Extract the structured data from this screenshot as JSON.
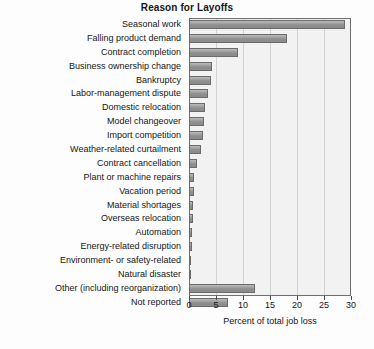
{
  "chart_data": {
    "type": "bar",
    "orientation": "horizontal",
    "title": "Reason for Layoffs",
    "xlabel": "Percent of total job loss",
    "ylabel": "",
    "xlim": [
      0,
      30
    ],
    "xticks": [
      0,
      5,
      10,
      15,
      20,
      25,
      30
    ],
    "xtick_labels": [
      "0",
      "5",
      "10",
      "15",
      "20",
      "25",
      "30"
    ],
    "grid": true,
    "legend": null,
    "categories": [
      "Seasonal work",
      "Falling product demand",
      "Contract completion",
      "Business ownership change",
      "Bankruptcy",
      "Labor-management dispute",
      "Domestic relocation",
      "Model changeover",
      "Import competition",
      "Weather-related curtailment",
      "Contract cancellation",
      "Plant or machine repairs",
      "Vacation period",
      "Material shortages",
      "Overseas relocation",
      "Automation",
      "Energy-related disruption",
      "Environment- or safety-related",
      "Natural disaster",
      "Other (including reorganization)",
      "Not reported"
    ],
    "values": [
      28.8,
      18.2,
      9.0,
      4.2,
      4.0,
      3.6,
      3.0,
      2.8,
      2.6,
      2.2,
      1.4,
      1.0,
      0.9,
      0.8,
      0.7,
      0.5,
      0.5,
      0.4,
      0.3,
      12.2,
      7.2
    ],
    "bar_color": "#9a9a9a",
    "plot_background": "#f2f2f2",
    "axis_color": "#6e6e6e"
  }
}
